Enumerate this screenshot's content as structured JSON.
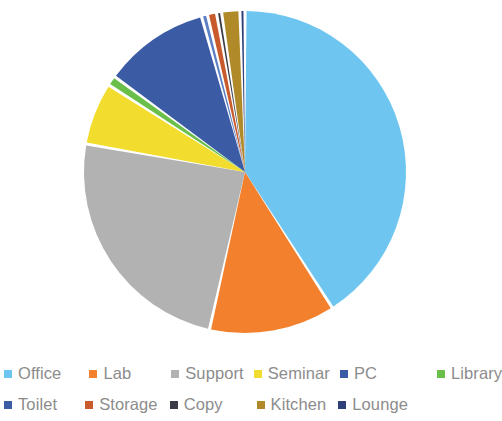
{
  "chart_data": {
    "type": "pie",
    "title": "",
    "subtitle": "",
    "xlabel": "",
    "ylabel": "",
    "legend_position": "bottom",
    "grid": false,
    "start_angle_deg": 0,
    "direction": "clockwise",
    "categories": [
      "Office",
      "Lab",
      "Support",
      "Seminar",
      "PC",
      "Library",
      "Toilet",
      "Storage",
      "Copy",
      "Kitchen",
      "Lounge"
    ],
    "values": [
      40.5,
      12.5,
      24.0,
      6.2,
      10.5,
      1.0,
      0.6,
      0.9,
      0.5,
      1.8,
      0.5
    ],
    "unit": "percent",
    "colors": [
      "#6ec6f0",
      "#f2802d",
      "#b2b2b2",
      "#f2dd2e",
      "#3b5ba5",
      "#6abf4b",
      "#5b7fc4",
      "#c85a2b",
      "#3b3b47",
      "#b08a28",
      "#2f3f7a"
    ],
    "slices": [
      {
        "label": "Office",
        "value": 40.5,
        "color": "#6ec6f0"
      },
      {
        "label": "Lab",
        "value": 12.5,
        "color": "#f2802d"
      },
      {
        "label": "Support",
        "value": 24.0,
        "color": "#b2b2b2"
      },
      {
        "label": "Seminar",
        "value": 6.2,
        "color": "#f2dd2e"
      },
      {
        "label": "Library",
        "value": 1.0,
        "color": "#6abf4b"
      },
      {
        "label": "PC",
        "value": 10.5,
        "color": "#3b5ba5"
      },
      {
        "label": "Toilet",
        "value": 0.6,
        "color": "#5b7fc4"
      },
      {
        "label": "Storage",
        "value": 0.9,
        "color": "#c85a2b"
      },
      {
        "label": "Copy",
        "value": 0.5,
        "color": "#3b3b47"
      },
      {
        "label": "Kitchen",
        "value": 1.8,
        "color": "#b08a28"
      },
      {
        "label": "Lounge",
        "value": 0.5,
        "color": "#2f3f7a"
      }
    ],
    "draw_order": [
      "Office",
      "Lab",
      "Support",
      "Seminar",
      "Library",
      "PC",
      "Toilet",
      "Storage",
      "Copy",
      "Kitchen",
      "Lounge"
    ]
  },
  "legend": {
    "rows": [
      {
        "items": [
          {
            "label": "Office",
            "color": "#6ec6f0",
            "gap_px": 0
          },
          {
            "label": "Lab",
            "color": "#f2802d",
            "gap_px": 28
          },
          {
            "label": "Support",
            "color": "#b2b2b2",
            "gap_px": 40
          },
          {
            "label": "Seminar",
            "color": "#f2dd2e",
            "gap_px": 10
          },
          {
            "label": "PC",
            "color": "#3b5ba5",
            "gap_px": 10
          },
          {
            "label": "Library",
            "color": "#6abf4b",
            "gap_px": 60
          }
        ]
      },
      {
        "items": [
          {
            "label": "Toilet",
            "color": "#3b5ba5",
            "gap_px": 0
          },
          {
            "label": "Storage",
            "color": "#c85a2b",
            "gap_px": 28
          },
          {
            "label": "Copy",
            "color": "#3b3b47",
            "gap_px": 12
          },
          {
            "label": "Kitchen",
            "color": "#b08a28",
            "gap_px": 34
          },
          {
            "label": "Lounge",
            "color": "#2f3f7a",
            "gap_px": 12
          }
        ]
      }
    ]
  },
  "geometry": {
    "center_x": 245,
    "center_y": 172,
    "radius": 161,
    "gap_deg": 1.1
  }
}
